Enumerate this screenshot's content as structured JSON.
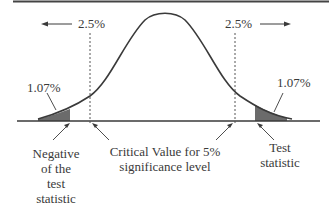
{
  "diagram": {
    "type": "two-tailed hypothesis test on normal distribution",
    "tail_area_left": "2.5%",
    "tail_area_right": "2.5%",
    "pvalue_left": "1.07%",
    "pvalue_right": "1.07%",
    "labels": {
      "negative_test_statistic": [
        "Negative",
        "of the",
        "test",
        "statistic"
      ],
      "critical_value": [
        "Critical Value for 5%",
        "significance level"
      ],
      "test_statistic": [
        "Test",
        "statistic"
      ]
    },
    "colors": {
      "curve": "#3a3a3a",
      "shade": "#6b6b6b",
      "axis": "#3a3a3a",
      "text": "#3a3a3a"
    }
  }
}
